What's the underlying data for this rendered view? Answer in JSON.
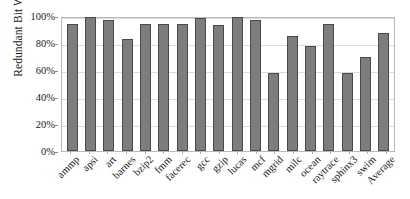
{
  "chart_data": {
    "type": "bar",
    "title": "",
    "xlabel": "",
    "ylabel": "Redundant Bit Writes",
    "ylim": [
      0,
      100
    ],
    "ytick_labels": [
      "0%",
      "20%",
      "40%",
      "60%",
      "80%",
      "100%"
    ],
    "ytick_values": [
      0,
      20,
      40,
      60,
      80,
      100
    ],
    "grid": true,
    "legend": null,
    "legend_position": "none",
    "bar_fill_color": "#7d7d7d",
    "bar_border_color": "#4a4a4a",
    "categories": [
      "ammp",
      "apsi",
      "art",
      "barnes",
      "bzip2",
      "fmm",
      "facerec",
      "gcc",
      "gzip",
      "lucas",
      "mcf",
      "mgrid",
      "milc",
      "ocean",
      "raytrace",
      "sphinx3",
      "swim",
      "Average"
    ],
    "values": [
      95,
      100,
      98,
      83.5,
      95,
      94.5,
      95,
      99,
      94,
      100,
      97.5,
      58.5,
      86,
      78,
      94.5,
      58.5,
      70.5,
      88
    ],
    "value_unit": "%"
  }
}
